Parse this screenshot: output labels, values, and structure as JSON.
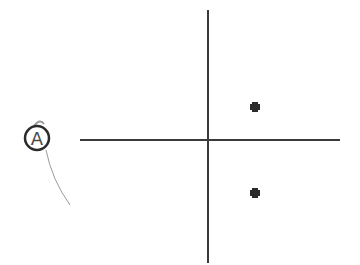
{
  "diagram": {
    "label": "A",
    "colors": {
      "line": "#3a3a3a",
      "point": "#2b2b2b",
      "label": "#4a4a4a",
      "tail": "#9a9a9a"
    },
    "axes": {
      "origin": [
        208,
        140
      ],
      "x_range": [
        80,
        340
      ],
      "y_range": [
        10,
        263
      ]
    },
    "points": [
      {
        "x": 255,
        "y": 107
      },
      {
        "x": 255,
        "y": 193
      }
    ]
  }
}
